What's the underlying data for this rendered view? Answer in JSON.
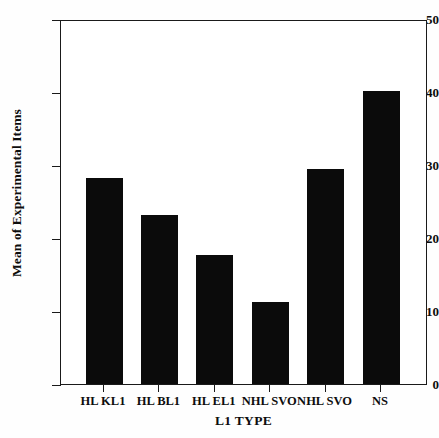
{
  "chart_data": {
    "type": "bar",
    "title": "",
    "xlabel": "L1 TYPE",
    "ylabel": "Mean of Experimental Items",
    "categories": [
      "HL KL1",
      "HL BL1",
      "HL EL1",
      "NHL SVO",
      "NHL SVO",
      "NS"
    ],
    "values": [
      28.2,
      23.2,
      17.7,
      11.2,
      29.4,
      40.2
    ],
    "ylim": [
      0,
      50
    ],
    "yticks": [
      0,
      10,
      20,
      30,
      40,
      50
    ],
    "ytick_labels": [
      "0",
      "10",
      "20",
      "30",
      "40",
      "50"
    ],
    "grid": false,
    "legend": false,
    "bar_color": "#0b0b0b",
    "frame_color": "#1a1a1a",
    "background": "#ffffff"
  }
}
